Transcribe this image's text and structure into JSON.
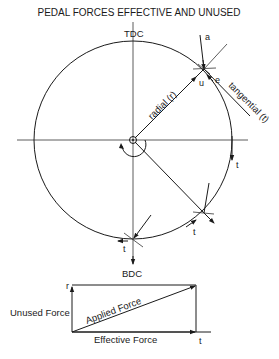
{
  "title": "PEDAL FORCES EFFECTIVE AND UNUSED",
  "crank_circle": {
    "top_label": "TDC",
    "bottom_label": "BDC",
    "radial_label": "radial (r)",
    "tangential_label": "tangential (t)",
    "point_labels": {
      "applied": "a",
      "unused": "u",
      "effective": "e"
    },
    "tangent_labels": [
      "t",
      "t",
      "t",
      "t"
    ]
  },
  "force_rectangle": {
    "r_label": "r",
    "t_label": "t",
    "unused_force_label": "Unused Force",
    "applied_force_label": "Applied Force",
    "effective_force_label": "Effective Force"
  },
  "colors": {
    "ink": "#1a1a1a",
    "background": "#ffffff"
  }
}
